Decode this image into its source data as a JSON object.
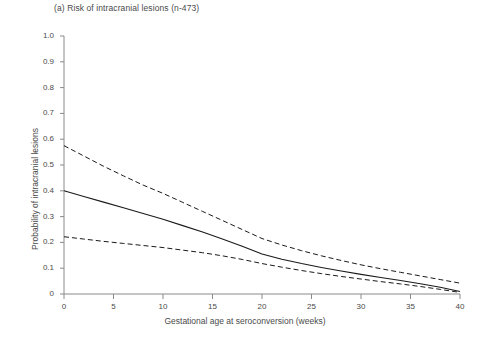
{
  "chart_data": {
    "type": "line",
    "title": "(a) Risk of intracranial lesions (n-473)",
    "xlabel": "Gestational age at seroconversion (weeks)",
    "ylabel": "Probability of intracranial lesions",
    "xlim": [
      0,
      40
    ],
    "ylim": [
      0,
      1.0
    ],
    "grid": false,
    "legend": "none",
    "xticks": [
      "0",
      "5",
      "10",
      "15",
      "20",
      "25",
      "30",
      "35",
      "40"
    ],
    "xtick_values": [
      0,
      5,
      10,
      15,
      20,
      25,
      30,
      35,
      40
    ],
    "yticks": [
      "0",
      "0.1",
      "0.2",
      "0.3",
      "0.4",
      "0.5",
      "0.6",
      "0.7",
      "0.8",
      "0.9",
      "1.0"
    ],
    "ytick_values": [
      0,
      0.1,
      0.2,
      0.3,
      0.4,
      0.5,
      0.6,
      0.7,
      0.8,
      0.9,
      1.0
    ],
    "x": [
      0,
      2,
      4,
      6,
      8,
      10,
      12,
      14,
      16,
      18,
      20,
      22,
      24,
      26,
      28,
      30,
      32,
      34,
      36,
      38,
      40
    ],
    "series": [
      {
        "name": "Upper 95% confidence limit",
        "style": "dashed",
        "color": "#1a1a1a",
        "values": [
          0.575,
          0.535,
          0.495,
          0.458,
          0.422,
          0.39,
          0.355,
          0.32,
          0.285,
          0.25,
          0.215,
          0.19,
          0.168,
          0.148,
          0.13,
          0.113,
          0.098,
          0.084,
          0.07,
          0.056,
          0.042
        ]
      },
      {
        "name": "Estimated probability",
        "style": "solid",
        "color": "#1a1a1a",
        "values": [
          0.4,
          0.378,
          0.356,
          0.334,
          0.312,
          0.29,
          0.265,
          0.24,
          0.213,
          0.185,
          0.155,
          0.135,
          0.118,
          0.103,
          0.089,
          0.076,
          0.064,
          0.052,
          0.04,
          0.026,
          0.01
        ]
      },
      {
        "name": "Lower 95% confidence limit",
        "style": "dashed",
        "color": "#1a1a1a",
        "values": [
          0.222,
          0.213,
          0.204,
          0.196,
          0.188,
          0.18,
          0.17,
          0.16,
          0.148,
          0.134,
          0.118,
          0.104,
          0.091,
          0.079,
          0.068,
          0.058,
          0.048,
          0.039,
          0.029,
          0.018,
          0.006
        ]
      }
    ]
  },
  "axes": {
    "x_origin_px": 64,
    "y_origin_px": 294,
    "x_end_px": 460,
    "y_top_px": 36
  }
}
